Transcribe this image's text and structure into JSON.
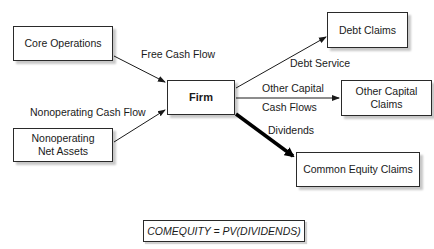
{
  "diagram": {
    "nodes": {
      "core_operations": "Core Operations",
      "nonoperating_line1": "Nonoperating",
      "nonoperating_line2": "Net Assets",
      "firm": "Firm",
      "debt_claims": "Debt Claims",
      "other_capital_line1": "Other Capital",
      "other_capital_line2": "Claims",
      "common_equity_claims": "Common Equity Claims"
    },
    "edges": {
      "free_cash_flow": "Free Cash Flow",
      "nonoperating_cash_flow": "Nonoperating Cash Flow",
      "debt_service": "Debt Service",
      "other_capital_line1": "Other Capital",
      "other_capital_line2": "Cash Flows",
      "dividends": "Dividends"
    },
    "equation": "COMEQUITY = PV(DIVIDENDS)",
    "colors": {
      "stroke": "#2a2a2a",
      "background": "#ffffff"
    }
  }
}
